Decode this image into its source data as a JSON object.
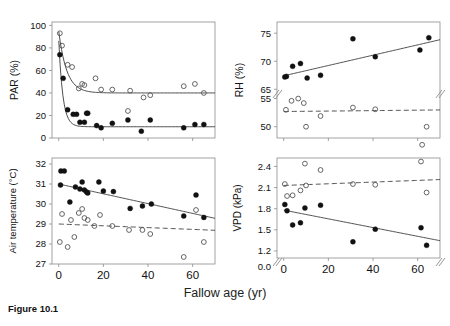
{
  "figure": {
    "caption": "Figure 10.1",
    "xlabel": "Fallow age (yr)",
    "xlim": [
      -3,
      70
    ],
    "xticks": [
      0,
      20,
      40,
      60
    ]
  },
  "chart_data": [
    {
      "type": "scatter",
      "id": "par",
      "title": "",
      "xlabel": "Fallow age (yr)",
      "ylabel": "PAR (%)",
      "xlim": [
        -3,
        70
      ],
      "ylim": [
        0,
        103
      ],
      "xticks": [
        0,
        20,
        40,
        60
      ],
      "yticks": [
        0,
        20,
        40,
        60,
        80,
        100
      ],
      "grid": false,
      "legend": "none",
      "axis_break": false,
      "series": [
        {
          "name": "open-circles",
          "marker": "open-circle",
          "x": [
            0.5,
            1.5,
            4,
            6,
            9,
            10.5,
            11.5,
            16.5,
            19,
            24,
            31,
            32,
            38,
            41,
            56,
            61,
            65
          ],
          "y": [
            93,
            82,
            65,
            63,
            44,
            48,
            47,
            53,
            43,
            43,
            24,
            42,
            36,
            38,
            46,
            48,
            40
          ]
        },
        {
          "name": "filled-circles",
          "marker": "filled-circle",
          "x": [
            0.5,
            2,
            4,
            6.5,
            8,
            9.5,
            11.5,
            12.5,
            13,
            17,
            19,
            24,
            31,
            37,
            41,
            56,
            61,
            65
          ],
          "y": [
            74,
            53,
            25,
            21,
            21,
            14,
            14,
            22,
            22,
            11,
            9,
            13,
            16,
            6,
            16,
            9,
            12,
            12,
            8
          ]
        }
      ],
      "fit_curves": [
        {
          "name": "open-fit",
          "style": "solid",
          "type": "exponential-decay",
          "y0": 95,
          "plateau": 40,
          "rate": 0.28
        },
        {
          "name": "filled-fit",
          "style": "solid",
          "type": "exponential-decay",
          "y0": 88,
          "plateau": 10,
          "rate": 0.55
        }
      ]
    },
    {
      "type": "scatter",
      "id": "rh",
      "title": "",
      "xlabel": "Fallow age (yr)",
      "ylabel": "RH (%)",
      "xlim": [
        -3,
        70
      ],
      "ylim": [
        48,
        77
      ],
      "xticks": [
        0,
        20,
        40,
        60
      ],
      "yticks": [
        50,
        55,
        65,
        70,
        75
      ],
      "grid": false,
      "legend": "none",
      "axis_break": true,
      "axis_break_between": [
        55,
        65
      ],
      "series": [
        {
          "name": "filled-circles",
          "marker": "filled-circle",
          "x": [
            0.5,
            1.2,
            4,
            7.5,
            10.5,
            16.5,
            31,
            41,
            61,
            65
          ],
          "y": [
            67.2,
            67.3,
            69.1,
            69.6,
            67.0,
            67.5,
            74.0,
            70.8,
            72.0,
            74.2
          ]
        },
        {
          "name": "open-circles",
          "marker": "open-circle",
          "x": [
            1,
            3.5,
            6.5,
            9,
            10,
            16.5,
            31,
            41,
            62,
            64
          ],
          "y": [
            53.0,
            54.6,
            55.0,
            54.2,
            50.0,
            51.9,
            53.4,
            53.1,
            55.1,
            50.0
          ]
        }
      ],
      "fit_curves": [
        {
          "name": "filled-fit",
          "style": "solid",
          "type": "linear",
          "intercept": 67.4,
          "slope": 0.092
        },
        {
          "name": "open-fit",
          "style": "dashed",
          "type": "linear",
          "intercept": 52.7,
          "slope": 0.004
        }
      ]
    },
    {
      "type": "scatter",
      "id": "airtemp",
      "title": "",
      "xlabel": "Fallow age (yr)",
      "ylabel": "Air temperature (°C)",
      "xlim": [
        -3,
        70
      ],
      "ylim": [
        27,
        32.3
      ],
      "xticks": [
        0,
        20,
        40,
        60
      ],
      "yticks": [
        27,
        28,
        29,
        30,
        31,
        32
      ],
      "grid": false,
      "legend": "none",
      "axis_break": false,
      "series": [
        {
          "name": "filled-circles",
          "marker": "filled-circle",
          "x": [
            1,
            2.5,
            0.8,
            5,
            7.5,
            9.5,
            10.5,
            11.5,
            12.5,
            13,
            18,
            20,
            24.5,
            32,
            37.5,
            41.5,
            56,
            61.5,
            65
          ],
          "y": [
            31.65,
            31.65,
            30.95,
            30.1,
            30.85,
            30.75,
            31.1,
            30.7,
            30.6,
            30.55,
            31.1,
            30.65,
            30.62,
            29.78,
            29.9,
            30.0,
            29.4,
            30.45,
            29.33
          ]
        },
        {
          "name": "open-circles",
          "marker": "open-circle",
          "x": [
            0.5,
            1.5,
            4,
            5.5,
            7,
            9,
            10.5,
            11.5,
            13,
            16,
            18.5,
            24,
            31.5,
            37.5,
            41,
            56,
            61.5,
            65
          ],
          "y": [
            28.1,
            29.5,
            27.85,
            29.2,
            28.35,
            29.55,
            29.75,
            29.3,
            29.2,
            28.9,
            29.45,
            28.9,
            28.7,
            28.7,
            28.5,
            27.35,
            29.7,
            28.1
          ]
        }
      ],
      "fit_curves": [
        {
          "name": "filled-fit",
          "style": "solid",
          "type": "linear",
          "intercept": 31.0,
          "slope": -0.0245
        },
        {
          "name": "open-fit",
          "style": "dashed",
          "type": "linear",
          "intercept": 29.0,
          "slope": -0.0045
        }
      ]
    },
    {
      "type": "scatter",
      "id": "vpd",
      "title": "",
      "xlabel": "Fallow age (yr)",
      "ylabel": "VPD (kPa)",
      "xlim": [
        -3,
        70
      ],
      "ylim": [
        1.1,
        2.52
      ],
      "xticks": [
        0,
        20,
        40,
        60
      ],
      "yticks": [
        1.2,
        1.5,
        1.8,
        2.1,
        2.4
      ],
      "ybreak_label": "0.0",
      "grid": false,
      "legend": "none",
      "axis_break": true,
      "series": [
        {
          "name": "open-circles",
          "marker": "open-circle",
          "x": [
            0.5,
            1.5,
            4,
            7.5,
            9.5,
            10,
            16.5,
            31,
            41,
            61.5,
            64
          ],
          "y": [
            2.15,
            1.98,
            1.99,
            2.06,
            2.44,
            2.13,
            2.35,
            2.15,
            2.14,
            2.47,
            2.03
          ]
        },
        {
          "name": "filled-circles",
          "marker": "filled-circle",
          "x": [
            0.5,
            1.5,
            4,
            7.5,
            9.5,
            16.5,
            31,
            41,
            61.5,
            64
          ],
          "y": [
            1.86,
            1.77,
            1.57,
            1.6,
            1.81,
            1.85,
            1.33,
            1.51,
            1.53,
            1.28
          ]
        }
      ],
      "fit_curves": [
        {
          "name": "open-fit",
          "style": "dashed",
          "type": "linear",
          "intercept": 2.13,
          "slope": 0.0012
        },
        {
          "name": "filled-fit",
          "style": "solid",
          "type": "linear",
          "intercept": 1.78,
          "slope": -0.0062
        }
      ]
    }
  ]
}
